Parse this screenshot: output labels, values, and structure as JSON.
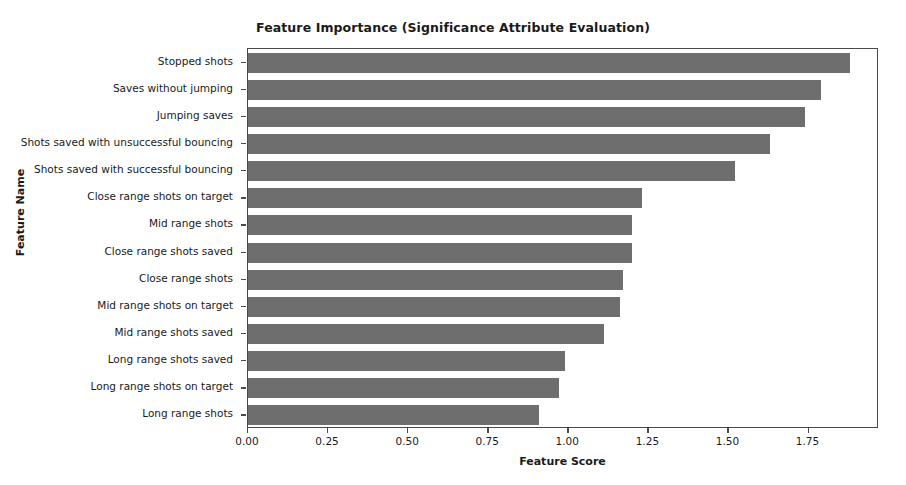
{
  "chart_data": {
    "type": "bar",
    "orientation": "horizontal",
    "title": "Feature Importance (Significance Attribute Evaluation)",
    "xlabel": "Feature Score",
    "ylabel": "Feature Name",
    "xlim": [
      0.0,
      1.97
    ],
    "xticks": [
      0.0,
      0.25,
      0.5,
      0.75,
      1.0,
      1.25,
      1.5,
      1.75
    ],
    "xtick_labels": [
      "0.00",
      "0.25",
      "0.50",
      "0.75",
      "1.00",
      "1.25",
      "1.50",
      "1.75"
    ],
    "grid": false,
    "legend": null,
    "bar_color": "#6e6e6e",
    "categories": [
      "Stopped shots",
      "Saves without jumping",
      "Jumping saves",
      "Shots saved with unsuccessful bouncing",
      "Shots saved with successful bouncing",
      "Close range shots on target",
      "Mid range shots",
      "Close range shots saved",
      "Close range shots",
      "Mid range shots on target",
      "Mid range shots saved",
      "Long range shots saved",
      "Long range shots on target",
      "Long range shots"
    ],
    "values": [
      1.88,
      1.79,
      1.74,
      1.63,
      1.52,
      1.23,
      1.2,
      1.2,
      1.17,
      1.16,
      1.11,
      0.99,
      0.97,
      0.91
    ]
  }
}
